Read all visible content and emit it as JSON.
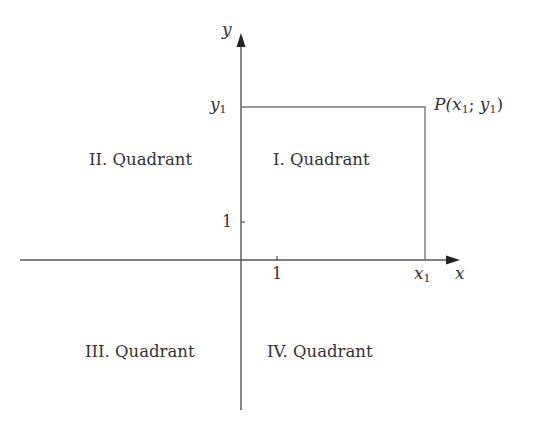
{
  "diagram": {
    "axes": {
      "x_label": "x",
      "y_label": "y",
      "x_tick_label": "1",
      "y_tick_label": "1"
    },
    "point": {
      "label_prefix": "P(",
      "x_var": "x",
      "x_sub": "1",
      "separator": "; ",
      "y_var": "y",
      "y_sub": "1",
      "label_suffix": ")",
      "x_axis_marker_var": "x",
      "x_axis_marker_sub": "1",
      "y_axis_marker_var": "y",
      "y_axis_marker_sub": "1"
    },
    "quadrants": [
      {
        "id": "I",
        "label": "I. Quadrant"
      },
      {
        "id": "II",
        "label": "II. Quadrant"
      },
      {
        "id": "III",
        "label": "III. Quadrant"
      },
      {
        "id": "IV",
        "label": "IV. Quadrant"
      }
    ],
    "colors": {
      "axis": "#444444",
      "rectangle": "#666666",
      "text": "#333333"
    }
  }
}
